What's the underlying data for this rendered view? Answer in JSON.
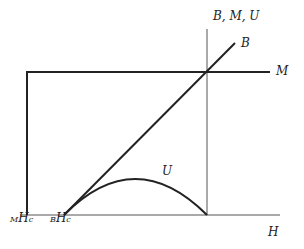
{
  "diagram": {
    "axis_label_y": "B, M, U",
    "axis_label_x": "H",
    "curve_labels": {
      "B": "B",
      "M": "M",
      "U": "U"
    },
    "tick_labels": {
      "MHc_sub": "M",
      "MHc_main": "H",
      "MHc_subc": "c",
      "BHc_sub": "B",
      "BHc_main": "H",
      "BHc_subc": "c"
    }
  }
}
